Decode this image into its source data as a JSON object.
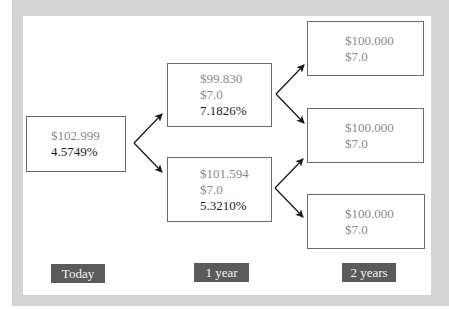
{
  "diagram": {
    "nodes": {
      "today": {
        "price": "$102.999",
        "rate": "4.5749%"
      },
      "year1_up": {
        "price": "$99.830",
        "coupon": "$7.0",
        "rate": "7.1826%"
      },
      "year1_down": {
        "price": "$101.594",
        "coupon": "$7.0",
        "rate": "5.3210%"
      },
      "year2_top": {
        "price": "$100.000",
        "coupon": "$7.0"
      },
      "year2_mid": {
        "price": "$100.000",
        "coupon": "$7.0"
      },
      "year2_bottom": {
        "price": "$100.000",
        "coupon": "$7.0"
      }
    },
    "timeline": [
      "Today",
      "1 year",
      "2 years"
    ],
    "colors": {
      "frame": "#d4d4d4",
      "panel": "#ffffff",
      "box_border": "#6b6b6b",
      "muted_text": "#8a8a8a",
      "strong_text": "#1e1e1e",
      "tag_bg": "#5b5b5b",
      "arrow": "#1a1a1a"
    }
  }
}
